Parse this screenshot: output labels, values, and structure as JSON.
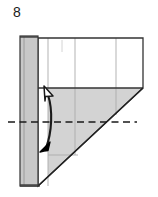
{
  "figure": {
    "step_number": "8",
    "type": "origami-folding-diagram",
    "caption": "",
    "colors": {
      "paper_front_fill": "#ffffff",
      "paper_back_fill": "#d3d3d3",
      "strip_fill": "#c8c8c8",
      "outline": "#1a1a1a",
      "crease_line": "#9a9a9a",
      "fold_axis_dash": "#1a1a1a",
      "arrow_solid": "#000000",
      "arrow_hollow_fill": "#ffffff",
      "background": "#ffffff"
    },
    "elements": {
      "upper_panel_label": "white upper panel",
      "gray_triangle_label": "shaded lower triangle",
      "left_strip_label": "left vertical gray strip",
      "fold_axis_label": "horizontal dashed fold axis",
      "arrow_label": "double-headed curved valley-fold arrow",
      "arrow_head_up_label": "hollow arrowhead pointing up-right",
      "arrow_head_down_label": "solid arrowhead pointing down-left"
    },
    "geometry": {
      "strip_x_left": 20,
      "strip_x_right": 38,
      "panel_top": 38,
      "panel_bottom": 186,
      "panel_right": 143,
      "triangle_top": 88,
      "fold_axis_y": 122,
      "fold_axis_x_start": 8,
      "fold_axis_x_end": 137,
      "crease_x_positions": [
        48,
        75,
        116
      ],
      "crease_y_positions": [
        88,
        155
      ]
    }
  }
}
